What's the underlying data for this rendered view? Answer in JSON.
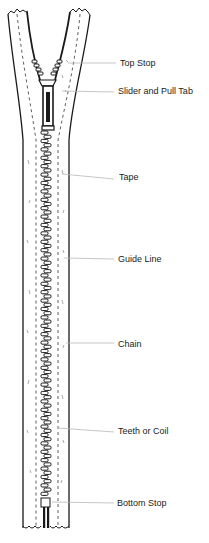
{
  "diagram": {
    "colors": {
      "ink": "#1a1a1a",
      "leader_line": "#b8b8b8",
      "label_text": "#222222",
      "background": "#ffffff"
    },
    "labels": [
      {
        "id": "top-stop",
        "text": "Top Stop",
        "x": 120,
        "y": 58,
        "line_from": [
          68,
          63
        ],
        "line_to": [
          116,
          63
        ]
      },
      {
        "id": "slider-and-pull-tab",
        "text": "Slider and Pull Tab",
        "x": 118,
        "y": 86,
        "line_from": [
          62,
          91
        ],
        "line_to": [
          114,
          92
        ]
      },
      {
        "id": "tape",
        "text": "Tape",
        "x": 119,
        "y": 172,
        "line_from": [
          62,
          174
        ],
        "line_to": [
          114,
          179
        ]
      },
      {
        "id": "guide-line",
        "text": "Guide Line",
        "x": 118,
        "y": 254,
        "line_from": [
          64,
          258
        ],
        "line_to": [
          114,
          259
        ]
      },
      {
        "id": "chain",
        "text": "Chain",
        "x": 118,
        "y": 339,
        "line_from": [
          66,
          343
        ],
        "line_to": [
          114,
          343
        ]
      },
      {
        "id": "teeth-or-coil",
        "text": "Teeth or Coil",
        "x": 118,
        "y": 426,
        "line_from": [
          58,
          428
        ],
        "line_to": [
          114,
          432
        ]
      },
      {
        "id": "bottom-stop",
        "text": "Bottom Stop",
        "x": 117,
        "y": 498,
        "line_from": [
          52,
          502
        ],
        "line_to": [
          114,
          503
        ]
      }
    ]
  }
}
